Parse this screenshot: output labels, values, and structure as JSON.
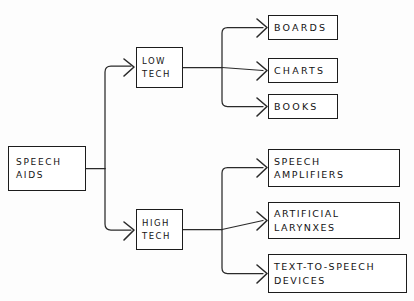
{
  "diagram": {
    "style": {
      "background": "#fdfdfd",
      "ink": "#1c1c1c",
      "line": "#2a2a2a"
    },
    "root": {
      "id": "speech-aids",
      "lines": [
        "SPEECH",
        "AIDS"
      ],
      "x": 8,
      "y": 146,
      "w": 78,
      "h": 45
    },
    "branches": [
      {
        "id": "low-tech",
        "lines": [
          "LOW",
          "TECH"
        ],
        "x": 136,
        "y": 47,
        "w": 47,
        "h": 41,
        "children": [
          {
            "id": "boards",
            "lines": [
              "BOARDS"
            ],
            "x": 268,
            "y": 15,
            "w": 70,
            "h": 25
          },
          {
            "id": "charts",
            "lines": [
              "CHARTS"
            ],
            "x": 268,
            "y": 58,
            "w": 70,
            "h": 25
          },
          {
            "id": "books",
            "lines": [
              "BOOKS"
            ],
            "x": 268,
            "y": 94,
            "w": 70,
            "h": 25
          }
        ]
      },
      {
        "id": "high-tech",
        "lines": [
          "HIGH",
          "TECH"
        ],
        "x": 136,
        "y": 209,
        "w": 47,
        "h": 41,
        "children": [
          {
            "id": "speech-amplifiers",
            "lines": [
              "SPEECH",
              "AMPLIFIERS"
            ],
            "x": 268,
            "y": 149,
            "w": 132,
            "h": 38
          },
          {
            "id": "artificial-larynxes",
            "lines": [
              "ARTIFICIAL",
              "LARYNXES"
            ],
            "x": 268,
            "y": 202,
            "w": 132,
            "h": 37
          },
          {
            "id": "text-to-speech-devices",
            "lines": [
              "TEXT-TO-SPEECH",
              "DEVICES"
            ],
            "x": 268,
            "y": 254,
            "w": 139,
            "h": 39
          }
        ]
      }
    ]
  }
}
